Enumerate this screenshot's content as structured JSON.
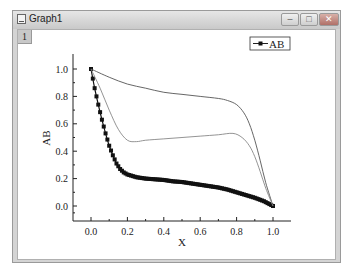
{
  "window": {
    "title": "Graph1",
    "layer_label": "1",
    "controls": {
      "minimize": "–",
      "maximize": "□",
      "close": "✕"
    }
  },
  "legend": {
    "entries": [
      "AB"
    ]
  },
  "chart_data": {
    "type": "line",
    "title": "",
    "xlabel": "X",
    "ylabel": "AB",
    "xlim": [
      -0.1,
      1.1
    ],
    "ylim": [
      -0.1,
      1.15
    ],
    "xticks": [
      "0.0",
      "0.2",
      "0.4",
      "0.6",
      "0.8",
      "1.0"
    ],
    "yticks": [
      "0.0",
      "0.2",
      "0.4",
      "0.6",
      "0.8",
      "1.0"
    ],
    "grid": false,
    "legend_position": "top-right",
    "series": [
      {
        "name": "AB",
        "style": "line+square-markers",
        "x": [
          0.0,
          0.02,
          0.04,
          0.06,
          0.08,
          0.1,
          0.12,
          0.14,
          0.16,
          0.18,
          0.2,
          0.25,
          0.3,
          0.35,
          0.4,
          0.45,
          0.5,
          0.55,
          0.6,
          0.65,
          0.7,
          0.75,
          0.8,
          0.85,
          0.9,
          0.95,
          1.0
        ],
        "y": [
          1.0,
          0.86,
          0.74,
          0.63,
          0.53,
          0.44,
          0.37,
          0.31,
          0.27,
          0.245,
          0.23,
          0.21,
          0.2,
          0.195,
          0.19,
          0.18,
          0.175,
          0.165,
          0.155,
          0.145,
          0.135,
          0.12,
          0.1,
          0.08,
          0.06,
          0.035,
          0.0
        ]
      },
      {
        "name": "upper-curve",
        "style": "line",
        "x": [
          0.0,
          0.1,
          0.2,
          0.3,
          0.4,
          0.5,
          0.6,
          0.7,
          0.75,
          0.8,
          0.84,
          0.87,
          0.9,
          0.93,
          0.96,
          1.0
        ],
        "y": [
          1.0,
          0.94,
          0.89,
          0.86,
          0.83,
          0.815,
          0.8,
          0.785,
          0.77,
          0.74,
          0.68,
          0.6,
          0.48,
          0.33,
          0.17,
          0.0
        ]
      },
      {
        "name": "middle-curve",
        "style": "line",
        "x": [
          0.0,
          0.05,
          0.1,
          0.15,
          0.2,
          0.25,
          0.3,
          0.4,
          0.5,
          0.6,
          0.7,
          0.78,
          0.83,
          0.87,
          0.9,
          0.93,
          0.96,
          1.0
        ],
        "y": [
          1.0,
          0.86,
          0.7,
          0.56,
          0.48,
          0.47,
          0.48,
          0.49,
          0.5,
          0.51,
          0.52,
          0.53,
          0.5,
          0.44,
          0.36,
          0.25,
          0.13,
          0.0
        ]
      }
    ]
  }
}
